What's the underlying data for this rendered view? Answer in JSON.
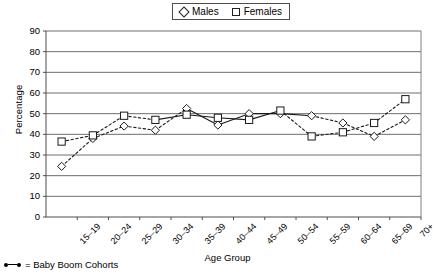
{
  "legend": {
    "position": "top-center",
    "entries": [
      {
        "label": "Males",
        "marker": "diamond-icon"
      },
      {
        "label": "Females",
        "marker": "square-icon"
      }
    ]
  },
  "axes": {
    "ylabel": "Percentage",
    "xlabel": "Age Group",
    "yticks": [
      "90",
      "80",
      "70",
      "60",
      "50",
      "40",
      "30",
      "20",
      "10",
      "0"
    ]
  },
  "footnote": {
    "symbol": "baby-boom-line-icon",
    "text": "= Baby Boom Cohorts"
  },
  "chart_data": {
    "type": "line",
    "title": "",
    "xlabel": "Age Group",
    "ylabel": "Percentage",
    "ylim": [
      0,
      90
    ],
    "ytick_step": 10,
    "grid": true,
    "legend_position": "top-center",
    "categories": [
      "15–19",
      "20–24",
      "25–29",
      "30–34",
      "35–39",
      "40–44",
      "45–49",
      "50–54",
      "55–59",
      "60–64",
      "65–69",
      "70+"
    ],
    "series": [
      {
        "name": "Males",
        "marker": "diamond",
        "values": [
          24.5,
          38,
          44,
          42,
          52.5,
          44.5,
          50,
          50,
          49,
          45.5,
          39,
          47
        ]
      },
      {
        "name": "Females",
        "marker": "square",
        "values": [
          36.5,
          39.5,
          49,
          47,
          49.5,
          48,
          47,
          51.5,
          39,
          41,
          45.5,
          57
        ]
      }
    ],
    "annotations": [
      {
        "text": "= Baby Boom Cohorts",
        "note": "dashed segments mark baby boom cohorts"
      }
    ]
  }
}
